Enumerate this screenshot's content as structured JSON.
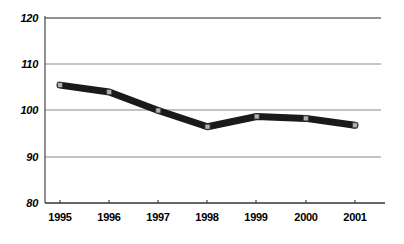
{
  "chart_data": {
    "type": "line",
    "title": "",
    "subtitle": "",
    "xlabel": "",
    "ylabel": "",
    "categories": [
      "1995",
      "1996",
      "1997",
      "1998",
      "1999",
      "2000",
      "2001"
    ],
    "series": [
      {
        "name": "",
        "values": [
          105.5,
          104.0,
          100.0,
          96.5,
          98.7,
          98.3,
          96.8
        ]
      }
    ],
    "ylim": [
      80,
      120
    ],
    "yticks": [
      80,
      90,
      100,
      110,
      120
    ],
    "ytick_labels": [
      "80",
      "90",
      "100",
      "110",
      "120"
    ],
    "xtick_labels": [
      "1995",
      "1996",
      "1997",
      "1998",
      "1999",
      "2000",
      "2001"
    ],
    "grid": true,
    "grid_axis": "y",
    "legend": false,
    "legend_position": "none",
    "annotations": [],
    "colors": {
      "line": "#1a1a1a",
      "marker_fill": "#b0b0b0",
      "marker_edge": "#1a1a1a",
      "grid": "#808080",
      "axis": "#4d4d4d",
      "text": "#000000",
      "background": "#ffffff"
    },
    "style": {
      "line_width": 7,
      "marker": "square",
      "marker_size": 5
    }
  },
  "axes": {
    "y_axis_name": "value-axis",
    "x_axis_name": "year-axis"
  }
}
